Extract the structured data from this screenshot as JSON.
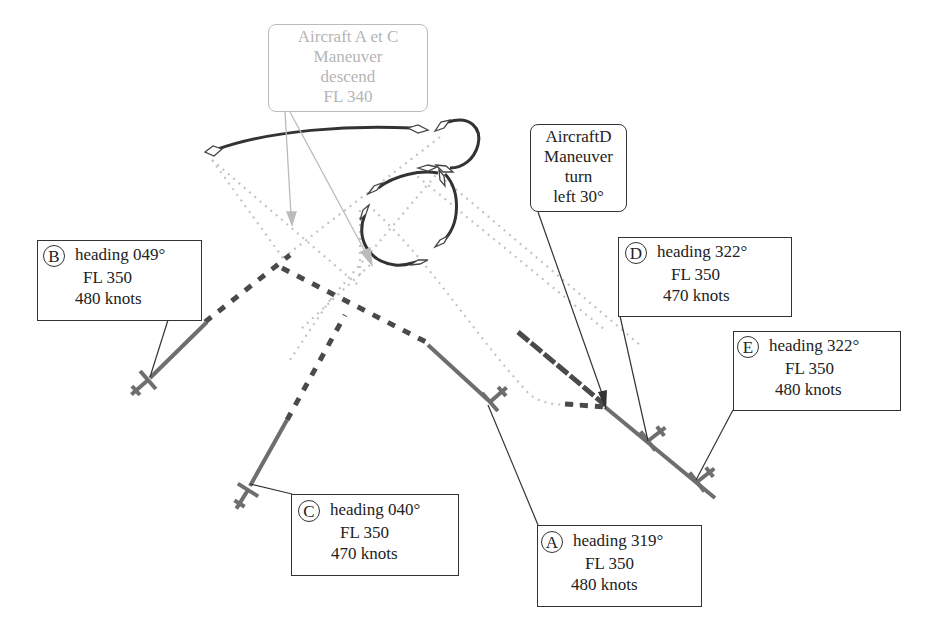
{
  "diagram": {
    "type": "air-traffic-conflict-resolution",
    "colors": {
      "track": "#6e6e6e",
      "dashed_track": "#4a4a4a",
      "dotted_projection": "#c4c4c4",
      "maneuver_path": "#333333",
      "gray_callout": "#b5b5b5",
      "dark_callout": "#333333"
    },
    "aircraft": [
      {
        "id": "A",
        "heading_label": "heading 319°",
        "fl_label": "FL 350",
        "speed_label": "480 knots"
      },
      {
        "id": "B",
        "heading_label": "heading 049°",
        "fl_label": "FL 350",
        "speed_label": "480 knots"
      },
      {
        "id": "C",
        "heading_label": "heading 040°",
        "fl_label": "FL 350",
        "speed_label": "470 knots"
      },
      {
        "id": "D",
        "heading_label": "heading 322°",
        "fl_label": "FL 350",
        "speed_label": "470 knots"
      },
      {
        "id": "E",
        "heading_label": "heading 322°",
        "fl_label": "FL 350",
        "speed_label": "480 knots"
      }
    ],
    "maneuvers": [
      {
        "id": "ac-maneuver",
        "lines": [
          "Aircraft A et C",
          "Maneuver",
          "descend",
          "FL  340"
        ]
      },
      {
        "id": "d-maneuver",
        "lines": [
          "AircraftD",
          "Maneuver",
          "turn",
          "left 30°"
        ]
      }
    ]
  }
}
